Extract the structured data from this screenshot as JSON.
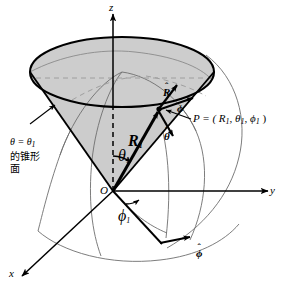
{
  "figure": {
    "width": 281,
    "height": 289,
    "background_color": "#ffffff",
    "cone_fill_color": "#cccccc",
    "line_color": "#000000",
    "arc_color": "#6b6b6b",
    "dash_color": "#9a9a9a"
  },
  "axes": {
    "z_label": "z",
    "y_label": "y",
    "x_label": "x",
    "origin_label": "O"
  },
  "labels": {
    "radius_vector": "R",
    "radius_vector_sub": "1",
    "theta_angle": "θ",
    "theta_angle_sub": "1",
    "phi_angle": "ϕ",
    "phi_angle_sub": "1",
    "unit_R": "R",
    "unit_theta": "θ",
    "unit_phi": "ϕ",
    "unit_phi_2": "ϕ",
    "hat_mark": "ˆ",
    "point_label": "P = ( R",
    "point_sub1": "1",
    "point_sep1": ", θ",
    "point_sub2": "1",
    "point_sep2": ", ϕ",
    "point_sub3": "1",
    "point_close": " )"
  },
  "annotation": {
    "cone_note_line1_math": "θ = θ",
    "cone_note_line1_sub": "1",
    "cone_note_line2": "的锥形",
    "cone_note_line3": "面"
  }
}
